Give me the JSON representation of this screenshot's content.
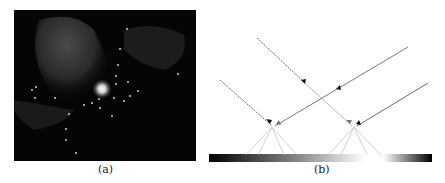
{
  "figure": {
    "panels": [
      {
        "id": "a",
        "caption": "(a)",
        "type": "astronomical-image",
        "description": "dark nebula image with bright central star and scattered point sources"
      },
      {
        "id": "b",
        "caption": "(b)",
        "type": "ray-diagram",
        "description": "dashed and solid rays converging to two points above a gradient bar"
      }
    ],
    "colors": {
      "background": "#ffffff",
      "image_bg": "#050505",
      "ray_dark": "#444444",
      "ray_light": "#bbbbbb"
    }
  }
}
